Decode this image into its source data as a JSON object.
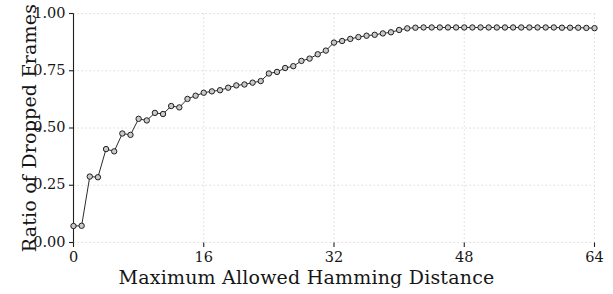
{
  "chart_data": {
    "type": "line",
    "title": "",
    "xlabel": "Maximum Allowed Hamming Distance",
    "ylabel": "Ratio of Dropped Frames",
    "xlim": [
      0,
      64
    ],
    "ylim": [
      0.0,
      1.0
    ],
    "xticks": [
      0,
      16,
      32,
      48,
      64
    ],
    "xtick_labels": [
      "0",
      "16",
      "32",
      "48",
      "64"
    ],
    "yticks": [
      0.0,
      0.25,
      0.5,
      0.75,
      1.0
    ],
    "ytick_labels": [
      "0.00",
      "0.25",
      "0.50",
      "0.75",
      "1.00"
    ],
    "grid": true,
    "legend": null,
    "marker": "circle-open",
    "line_color": "#2b2b2b",
    "marker_face_color": "#c9c9c9",
    "marker_edge_color": "#1f1f1f",
    "grid_color": "#d8d8d8",
    "x": [
      0,
      1,
      2,
      3,
      4,
      5,
      6,
      7,
      8,
      9,
      10,
      11,
      12,
      13,
      14,
      15,
      16,
      17,
      18,
      19,
      20,
      21,
      22,
      23,
      24,
      25,
      26,
      27,
      28,
      29,
      30,
      31,
      32,
      33,
      34,
      35,
      36,
      37,
      38,
      39,
      40,
      41,
      42,
      43,
      44,
      45,
      46,
      47,
      48,
      49,
      50,
      51,
      52,
      53,
      54,
      55,
      56,
      57,
      58,
      59,
      60,
      61,
      62,
      63,
      64
    ],
    "y": [
      0.072,
      0.073,
      0.288,
      0.285,
      0.408,
      0.398,
      0.476,
      0.47,
      0.54,
      0.533,
      0.566,
      0.561,
      0.596,
      0.59,
      0.627,
      0.641,
      0.654,
      0.66,
      0.665,
      0.676,
      0.686,
      0.69,
      0.698,
      0.705,
      0.738,
      0.745,
      0.762,
      0.77,
      0.793,
      0.803,
      0.822,
      0.838,
      0.873,
      0.88,
      0.889,
      0.897,
      0.903,
      0.907,
      0.913,
      0.918,
      0.928,
      0.935,
      0.938,
      0.939,
      0.939,
      0.939,
      0.939,
      0.939,
      0.939,
      0.939,
      0.939,
      0.939,
      0.939,
      0.939,
      0.939,
      0.939,
      0.939,
      0.939,
      0.939,
      0.939,
      0.938,
      0.938,
      0.938,
      0.937,
      0.936
    ]
  },
  "axes": {
    "ylabel_text": "Ratio of Dropped Frames",
    "xlabel_text": "Maximum Allowed Hamming Distance"
  }
}
